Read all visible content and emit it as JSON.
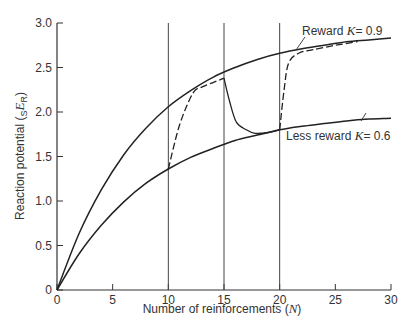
{
  "chart_data": {
    "type": "line",
    "title": "",
    "xlabel": "Number of reinforcements (N)",
    "xlabel_parts": {
      "text": "Number of reinforcements (",
      "var": "N",
      "close": ")"
    },
    "ylabel": "Reaction potential (sER)",
    "ylabel_parts": {
      "text": "Reaction potential (",
      "sub": "S",
      "var": "E",
      "sub2": "R",
      "close": ")"
    },
    "xlim": [
      0,
      30
    ],
    "ylim": [
      0,
      3.0
    ],
    "x_ticks": [
      0,
      5,
      10,
      15,
      20,
      25,
      30
    ],
    "y_ticks": [
      0,
      0.5,
      1.0,
      1.5,
      2.0,
      2.5,
      3.0
    ],
    "y_tick_labels": [
      "0",
      "0.5",
      "1.0",
      "1.5",
      "2.0",
      "2.5",
      "3.0"
    ],
    "grid": false,
    "vertical_lines": [
      10,
      15,
      20
    ],
    "series": [
      {
        "name": "Reward K = 0.9",
        "label": "Reward",
        "k_label": "K",
        "k_value": "= 0.9",
        "style": "solid",
        "x": [
          0,
          2,
          4,
          6,
          8,
          10,
          12,
          14,
          16,
          18,
          20,
          22,
          24,
          26,
          28,
          30
        ],
        "values": [
          0,
          0.64,
          1.13,
          1.52,
          1.82,
          2.06,
          2.24,
          2.39,
          2.5,
          2.59,
          2.66,
          2.71,
          2.75,
          2.79,
          2.81,
          2.83
        ]
      },
      {
        "name": "Less reward K = 0.6",
        "label": "Less reward",
        "k_label": "K",
        "k_value": "= 0.6",
        "style": "solid",
        "x": [
          0,
          2,
          4,
          6,
          8,
          10,
          12,
          14,
          16,
          18,
          20,
          22,
          24,
          26,
          28,
          30
        ],
        "values": [
          0,
          0.41,
          0.73,
          0.99,
          1.2,
          1.36,
          1.49,
          1.59,
          1.68,
          1.74,
          1.8,
          1.84,
          1.87,
          1.9,
          1.92,
          1.93
        ]
      },
      {
        "name": "Shift to reward (N=10)",
        "style": "dashed",
        "x": [
          10,
          11,
          12.2,
          13,
          14,
          15
        ],
        "values": [
          1.36,
          1.85,
          2.21,
          2.28,
          2.33,
          2.38
        ]
      },
      {
        "name": "Shift to less reward (N=15)",
        "style": "solid",
        "x": [
          15,
          15.5,
          16.1,
          17,
          17.8,
          19,
          20
        ],
        "values": [
          2.38,
          2.12,
          1.89,
          1.8,
          1.76,
          1.77,
          1.8
        ]
      },
      {
        "name": "Shift back to reward (N=20)",
        "style": "dashed",
        "x": [
          20,
          20.4,
          20.8,
          21.7,
          23,
          25,
          27
        ],
        "values": [
          1.8,
          2.25,
          2.55,
          2.66,
          2.7,
          2.75,
          2.79
        ]
      }
    ],
    "annotations": [
      {
        "text": "Reward K = 0.9",
        "x": 22,
        "y": 2.95
      },
      {
        "text": "Less reward K = 0.6",
        "x": 20.6,
        "y": 1.58
      }
    ]
  }
}
